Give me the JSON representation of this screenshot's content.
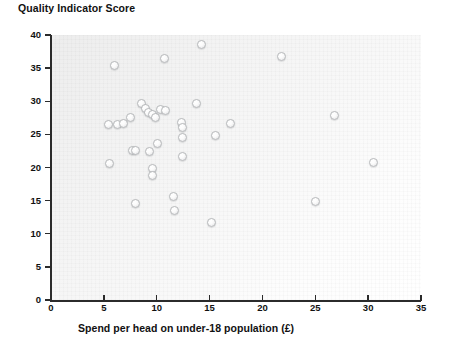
{
  "chart_data": {
    "type": "scatter",
    "title": "Quality Indicator Score",
    "xlabel": "Spend per head on under-18 population (£)",
    "ylabel": "Quality Indicator Score",
    "xlim": [
      0,
      35
    ],
    "ylim": [
      0,
      40
    ],
    "xticks": [
      0,
      5,
      10,
      15,
      20,
      25,
      30,
      35
    ],
    "yticks": [
      0,
      5,
      10,
      15,
      20,
      25,
      30,
      35,
      40
    ],
    "grid": false,
    "legend": "none",
    "marker_style": "open-circle-3d",
    "points": [
      {
        "x": 5.4,
        "y": 26.5
      },
      {
        "x": 5.5,
        "y": 20.6
      },
      {
        "x": 6.0,
        "y": 35.4
      },
      {
        "x": 6.3,
        "y": 26.5
      },
      {
        "x": 6.9,
        "y": 26.7
      },
      {
        "x": 7.5,
        "y": 27.6
      },
      {
        "x": 7.7,
        "y": 22.6
      },
      {
        "x": 8.0,
        "y": 22.6
      },
      {
        "x": 8.0,
        "y": 14.6
      },
      {
        "x": 8.6,
        "y": 29.6
      },
      {
        "x": 8.9,
        "y": 28.9
      },
      {
        "x": 9.2,
        "y": 28.3
      },
      {
        "x": 9.3,
        "y": 22.4
      },
      {
        "x": 9.6,
        "y": 28.0
      },
      {
        "x": 9.6,
        "y": 19.9
      },
      {
        "x": 9.6,
        "y": 18.8
      },
      {
        "x": 9.9,
        "y": 27.6
      },
      {
        "x": 10.1,
        "y": 23.6
      },
      {
        "x": 10.4,
        "y": 28.7
      },
      {
        "x": 10.7,
        "y": 36.5
      },
      {
        "x": 10.8,
        "y": 28.6
      },
      {
        "x": 11.6,
        "y": 15.6
      },
      {
        "x": 11.7,
        "y": 13.5
      },
      {
        "x": 12.3,
        "y": 26.8
      },
      {
        "x": 12.4,
        "y": 26.0
      },
      {
        "x": 12.4,
        "y": 24.6
      },
      {
        "x": 12.4,
        "y": 21.7
      },
      {
        "x": 13.8,
        "y": 29.6
      },
      {
        "x": 14.2,
        "y": 38.6
      },
      {
        "x": 15.2,
        "y": 11.7
      },
      {
        "x": 15.6,
        "y": 24.8
      },
      {
        "x": 17.0,
        "y": 26.7
      },
      {
        "x": 21.8,
        "y": 36.7
      },
      {
        "x": 25.0,
        "y": 14.8
      },
      {
        "x": 26.8,
        "y": 27.8
      },
      {
        "x": 30.5,
        "y": 20.7
      }
    ]
  }
}
